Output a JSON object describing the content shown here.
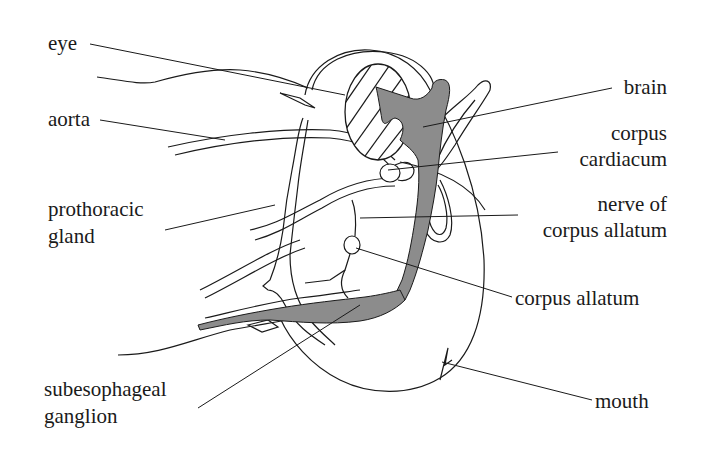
{
  "diagram": {
    "colors": {
      "line": "#1a1a1a",
      "nerve_fill": "#8c8c8c",
      "background": "#ffffff"
    },
    "labels": {
      "eye": "eye",
      "aorta": "aorta",
      "prothoracic_gland_1": "prothoracic",
      "prothoracic_gland_2": "gland",
      "subesophageal_ganglion_1": "subesophageal",
      "subesophageal_ganglion_2": "ganglion",
      "brain": "brain",
      "corpus_cardiacum_1": "corpus",
      "corpus_cardiacum_2": "cardiacum",
      "nerve_of_corpus_allatum_1": "nerve of",
      "nerve_of_corpus_allatum_2": "corpus allatum",
      "corpus_allatum": "corpus allatum",
      "mouth": "mouth"
    }
  }
}
